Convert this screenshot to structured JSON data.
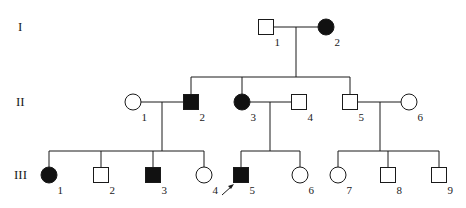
{
  "colors": {
    "line": "#1a1a1a",
    "affected": "#111111",
    "unaffected": "#ffffff"
  },
  "generations": [
    {
      "label": "I",
      "y": 27
    },
    {
      "label": "II",
      "y": 102
    },
    {
      "label": "III",
      "y": 175
    }
  ],
  "individuals": [
    {
      "id": "I-1",
      "gen": 0,
      "num": "1",
      "sex": "male",
      "affected": false,
      "x": 266,
      "y": 27
    },
    {
      "id": "I-2",
      "gen": 0,
      "num": "2",
      "sex": "female",
      "affected": true,
      "x": 326,
      "y": 27
    },
    {
      "id": "II-1",
      "gen": 1,
      "num": "1",
      "sex": "female",
      "affected": false,
      "x": 133,
      "y": 102
    },
    {
      "id": "II-2",
      "gen": 1,
      "num": "2",
      "sex": "male",
      "affected": true,
      "x": 191,
      "y": 102
    },
    {
      "id": "II-3",
      "gen": 1,
      "num": "3",
      "sex": "female",
      "affected": true,
      "x": 242,
      "y": 102
    },
    {
      "id": "II-4",
      "gen": 1,
      "num": "4",
      "sex": "male",
      "affected": false,
      "x": 299,
      "y": 102
    },
    {
      "id": "II-5",
      "gen": 1,
      "num": "5",
      "sex": "male",
      "affected": false,
      "x": 350,
      "y": 102
    },
    {
      "id": "II-6",
      "gen": 1,
      "num": "6",
      "sex": "female",
      "affected": false,
      "x": 409,
      "y": 102
    },
    {
      "id": "III-1",
      "gen": 2,
      "num": "1",
      "sex": "female",
      "affected": true,
      "x": 49,
      "y": 175
    },
    {
      "id": "III-2",
      "gen": 2,
      "num": "2",
      "sex": "male",
      "affected": false,
      "x": 101,
      "y": 175
    },
    {
      "id": "III-3",
      "gen": 2,
      "num": "3",
      "sex": "male",
      "affected": true,
      "x": 153,
      "y": 175
    },
    {
      "id": "III-4",
      "gen": 2,
      "num": "4",
      "sex": "female",
      "affected": false,
      "x": 204,
      "y": 175
    },
    {
      "id": "III-5",
      "gen": 2,
      "num": "5",
      "sex": "male",
      "affected": true,
      "x": 241,
      "y": 175,
      "proband": true
    },
    {
      "id": "III-6",
      "gen": 2,
      "num": "6",
      "sex": "female",
      "affected": false,
      "x": 300,
      "y": 175
    },
    {
      "id": "III-7",
      "gen": 2,
      "num": "7",
      "sex": "female",
      "affected": false,
      "x": 338,
      "y": 175
    },
    {
      "id": "III-8",
      "gen": 2,
      "num": "8",
      "sex": "male",
      "affected": false,
      "x": 388,
      "y": 175
    },
    {
      "id": "III-9",
      "gen": 2,
      "num": "9",
      "sex": "male",
      "affected": false,
      "x": 439,
      "y": 175
    }
  ],
  "matings": [
    {
      "a": "I-1",
      "b": "I-2",
      "drop_x": 296,
      "sibship_y": 77,
      "children": [
        "II-2",
        "II-3",
        "II-5"
      ]
    },
    {
      "a": "II-1",
      "b": "II-2",
      "drop_x": 162,
      "sibship_y": 151,
      "children": [
        "III-1",
        "III-2",
        "III-3",
        "III-4"
      ]
    },
    {
      "a": "II-3",
      "b": "II-4",
      "drop_x": 270,
      "sibship_y": 151,
      "children": [
        "III-5",
        "III-6"
      ]
    },
    {
      "a": "II-5",
      "b": "II-6",
      "drop_x": 380,
      "sibship_y": 151,
      "children": [
        "III-7",
        "III-8",
        "III-9"
      ]
    }
  ]
}
